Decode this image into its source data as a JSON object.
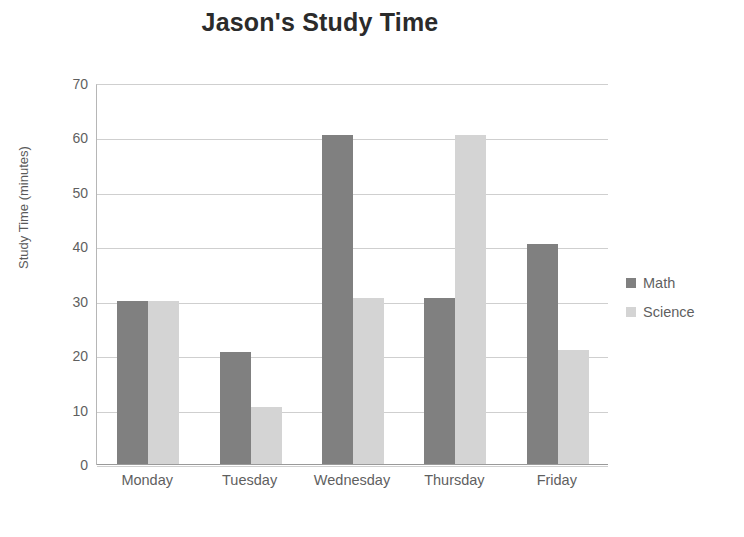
{
  "chart_data": {
    "type": "bar",
    "title": "Jason's Study Time",
    "xlabel": "",
    "ylabel": "Study Time (minutes)",
    "categories": [
      "Monday",
      "Tuesday",
      "Wednesday",
      "Thursday",
      "Friday"
    ],
    "series": [
      {
        "name": "Math",
        "color": "#808080",
        "values": [
          30,
          20.5,
          60.5,
          30.5,
          40.5
        ]
      },
      {
        "name": "Science",
        "color": "#d4d4d4",
        "values": [
          30,
          10.5,
          30.5,
          60.5,
          21
        ]
      }
    ],
    "ylim": [
      0,
      70
    ],
    "ytick_step": 10,
    "yticks": [
      70,
      60,
      50,
      40,
      30,
      20,
      10,
      0
    ],
    "ytick_labels": [
      "70",
      "60",
      "50",
      "40",
      "30",
      "20",
      "10",
      "0"
    ],
    "grid": true,
    "grid_axis": "y",
    "legend_position": "right",
    "background": "#ffffff",
    "grid_color": "#cfcfcf",
    "text_color": "#5f5f5f",
    "title_color": "#2b2b2b"
  }
}
